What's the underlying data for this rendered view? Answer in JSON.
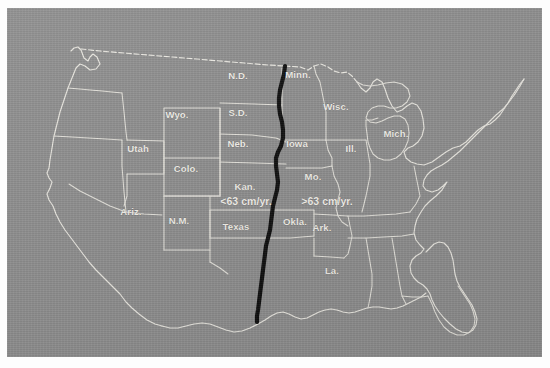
{
  "figure": {
    "kind": "thematic-map",
    "region": "Contiguous United States",
    "background_color": "#ffffff",
    "map_fill_color": "#8e8e8e",
    "boundary_color": "#eceae3",
    "isoline_color": "#0b0b0b"
  },
  "annotations": [
    {
      "id": "west-of-line",
      "text": "<63 cm/yr.",
      "x": 232,
      "y": 189
    },
    {
      "id": "east-of-line",
      "text": ">63 cm/yr.",
      "x": 313,
      "y": 189
    }
  ],
  "isoline": {
    "name": "63 cm/yr precipitation isohyet",
    "value_cm_per_year": 63,
    "start_point": [
      271,
      50
    ],
    "end_point": [
      243,
      306
    ]
  },
  "states": [
    {
      "abbr": "N.D.",
      "x": 224,
      "y": 63
    },
    {
      "abbr": "S.D.",
      "x": 224,
      "y": 100
    },
    {
      "abbr": "Neb.",
      "x": 224,
      "y": 131
    },
    {
      "abbr": "Wyo.",
      "x": 163,
      "y": 102
    },
    {
      "abbr": "Utah",
      "x": 124,
      "y": 136
    },
    {
      "abbr": "Colo.",
      "x": 172,
      "y": 156
    },
    {
      "abbr": "Kan.",
      "x": 231,
      "y": 174
    },
    {
      "abbr": "Ariz.",
      "x": 117,
      "y": 199
    },
    {
      "abbr": "N.M.",
      "x": 165,
      "y": 208
    },
    {
      "abbr": "Texas",
      "x": 222,
      "y": 214
    },
    {
      "abbr": "Okla.",
      "x": 281,
      "y": 209
    },
    {
      "abbr": "Minn.",
      "x": 284,
      "y": 62
    },
    {
      "abbr": "Wisc.",
      "x": 322,
      "y": 94
    },
    {
      "abbr": "Mich.",
      "x": 382,
      "y": 121
    },
    {
      "abbr": "Iowa",
      "x": 283,
      "y": 131
    },
    {
      "abbr": "Ill.",
      "x": 337,
      "y": 136
    },
    {
      "abbr": "Mo.",
      "x": 299,
      "y": 164
    },
    {
      "abbr": "Ark.",
      "x": 308,
      "y": 215
    },
    {
      "abbr": "La.",
      "x": 318,
      "y": 258
    }
  ]
}
